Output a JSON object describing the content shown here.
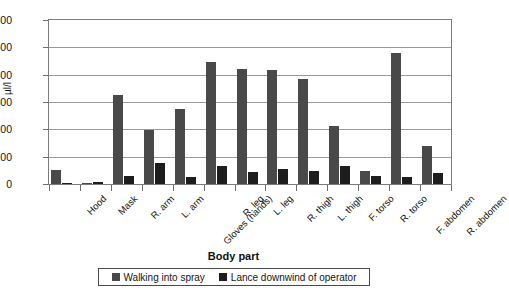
{
  "chart_data": {
    "type": "bar",
    "title": "",
    "xlabel": "Body part",
    "ylabel": "µl/l",
    "ylim": [
      0,
      600
    ],
    "ytick_step": 100,
    "yticks": [
      "600",
      "500",
      "400",
      "300",
      "200",
      "100",
      "0"
    ],
    "grid": true,
    "legend_position": "bottom",
    "categories": [
      "Hood",
      "Mask",
      "R. arm",
      "L. arm",
      "Gloves (hands)",
      "R. leg",
      "L. leg",
      "R. thigh",
      "L. thigh",
      "F. torso",
      "R. torso",
      "F. abdomen",
      "R. abdomen"
    ],
    "series": [
      {
        "name": "Walking into spray",
        "color": "#494949",
        "values": [
          50,
          2,
          326,
          197,
          275,
          445,
          420,
          416,
          384,
          212,
          49,
          479,
          140
        ]
      },
      {
        "name": "Lance downwind of operator",
        "color": "#1d1d1d",
        "values": [
          5,
          6,
          31,
          78,
          26,
          65,
          43,
          56,
          48,
          66,
          28,
          27,
          39
        ]
      }
    ]
  },
  "legend": {
    "items": [
      {
        "label": "Walking into spray"
      },
      {
        "label": "Lance downwind of operator"
      }
    ]
  }
}
